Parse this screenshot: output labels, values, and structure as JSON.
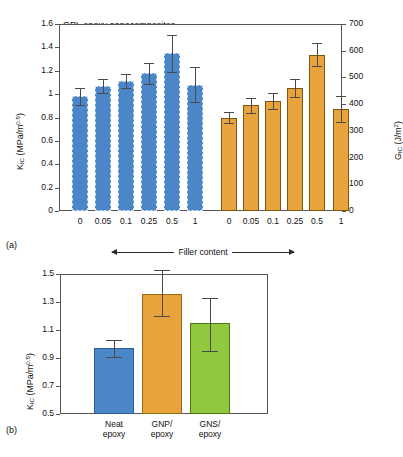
{
  "figure": {
    "panel_a_tag": "(a)",
    "panel_b_tag": "(b)"
  },
  "chart_data": [
    {
      "type": "bar",
      "panel": "(a)",
      "title": "GPL epoxy nanocomposites",
      "xlabel": "Filler content",
      "xlabel_arrow_left": "◀",
      "xlabel_arrow_right": "▶",
      "ylabel": "K_IC (MPa/m^0.5)",
      "ylabel_main": "K",
      "ylabel_sub": "IC",
      "ylabel_rest": " (MPa/m",
      "ylabel_sup": "0.5",
      "ylabel_tail": ")",
      "y2label": "G_IC (J/m^2)",
      "y2label_main": "G",
      "y2label_sub": "IC",
      "y2label_rest": " (J/m",
      "y2label_sup": "2",
      "y2label_tail": ")",
      "ylim": [
        0,
        1.6
      ],
      "yticks": [
        "0",
        "0.2",
        "0.4",
        "0.6",
        "0.8",
        "1",
        "1.2",
        "1.4",
        "1.6"
      ],
      "ytick_values": [
        0,
        0.2,
        0.4,
        0.6,
        0.8,
        1.0,
        1.2,
        1.4,
        1.6
      ],
      "y2lim": [
        0,
        700
      ],
      "y2ticks": [
        "0",
        "100",
        "200",
        "300",
        "400",
        "500",
        "600",
        "700"
      ],
      "y2tick_values": [
        0,
        100,
        200,
        300,
        400,
        500,
        600,
        700
      ],
      "grid": false,
      "legend": "none",
      "categories": [
        "0",
        "0.05",
        "0.1",
        "0.25",
        "0.5",
        "1"
      ],
      "series": [
        {
          "name": "K_IC",
          "axis": "left",
          "color": "#4a86c8",
          "hatch": "dashed-edge",
          "values": [
            0.98,
            1.07,
            1.11,
            1.18,
            1.35,
            1.08
          ],
          "errors": [
            0.07,
            0.06,
            0.06,
            0.09,
            0.16,
            0.15
          ]
        },
        {
          "name": "G_IC",
          "axis": "right",
          "color": "#e8a33d",
          "hatch": "solid",
          "values": [
            350,
            395,
            410,
            460,
            585,
            382
          ],
          "errors": [
            22,
            28,
            30,
            35,
            43,
            48
          ]
        }
      ]
    },
    {
      "type": "bar",
      "panel": "(b)",
      "title": "",
      "xlabel": "",
      "ylabel": "K_IC (MPa/m^0.5)",
      "ylabel_main": "K",
      "ylabel_sub": "IC",
      "ylabel_rest": " (MPa/m",
      "ylabel_sup": "0.5",
      "ylabel_tail": ")",
      "ylim": [
        0.5,
        1.5
      ],
      "yticks": [
        "0.5",
        "0.7",
        "0.9",
        "1.1",
        "1.3",
        "1.5"
      ],
      "ytick_values": [
        0.5,
        0.7,
        0.9,
        1.1,
        1.3,
        1.5
      ],
      "grid": false,
      "legend": "none",
      "categories": [
        "Neat\nepoxy",
        "GNP/\nepoxy",
        "GNS/\nepoxy"
      ],
      "category_lines": [
        [
          "Neat",
          "epoxy"
        ],
        [
          "GNP/",
          "epoxy"
        ],
        [
          "GNS/",
          "epoxy"
        ]
      ],
      "values": [
        0.97,
        1.36,
        1.15
      ],
      "errors_upper": [
        0.06,
        0.17,
        0.18
      ],
      "errors_lower": [
        0.06,
        0.16,
        0.2
      ],
      "colors": [
        "#4a86c8",
        "#e8a33d",
        "#92c83e"
      ]
    }
  ],
  "colors": {
    "blue": "#4a86c8",
    "orange": "#e8a33d",
    "green": "#92c83e",
    "axis": "#555555",
    "error": "#4a4a4a"
  }
}
